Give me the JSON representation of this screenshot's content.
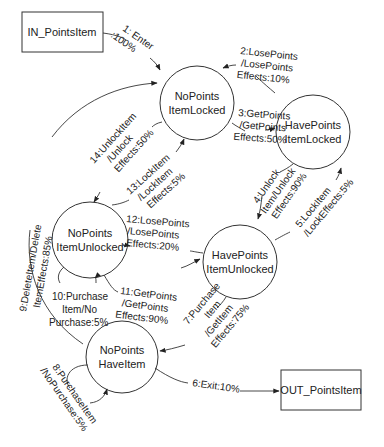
{
  "diagram": {
    "type": "state-transition",
    "terminals": {
      "in": {
        "label": "IN_PointsItem"
      },
      "out": {
        "label": "OUT_PointsItem"
      }
    },
    "states": [
      {
        "id": "nplocked",
        "line1": "NoPoints",
        "line2": "ItemLocked"
      },
      {
        "id": "hplocked",
        "line1": "HavePoints",
        "line2": "ItemLocked"
      },
      {
        "id": "npunlocked",
        "line1": "NoPoints",
        "line2": "ItemUnlocked"
      },
      {
        "id": "hpunlocked",
        "line1": "HavePoints",
        "line2": "ItemUnlocked"
      },
      {
        "id": "nphaveitem",
        "line1": "NoPoints",
        "line2": "HaveItem"
      }
    ],
    "transitions": [
      {
        "id": 1,
        "from": "in",
        "to": "nplocked",
        "lines": [
          "1: Enter",
          ":100%"
        ]
      },
      {
        "id": 2,
        "from": "hplocked",
        "to": "nplocked",
        "lines": [
          "2:LosePoints",
          "/LosePoints",
          "Effects:10%"
        ]
      },
      {
        "id": 3,
        "from": "nplocked",
        "to": "hplocked",
        "lines": [
          "3:GetPoints",
          "/GetPoints",
          "Effects:50%"
        ]
      },
      {
        "id": 4,
        "from": "hplocked",
        "to": "hpunlocked",
        "lines": [
          "4:Unlock",
          "Item/Unlock",
          "Effects:90%"
        ]
      },
      {
        "id": 5,
        "from": "hpunlocked",
        "to": "hplocked",
        "lines": [
          "5:LockItem",
          "/LockEffects:5%"
        ]
      },
      {
        "id": 6,
        "from": "nphaveitem",
        "to": "out",
        "lines": [
          "6:Exit:10%"
        ]
      },
      {
        "id": 7,
        "from": "hpunlocked",
        "to": "nphaveitem",
        "lines": [
          "7:Purchase",
          "Item",
          "/GetItem",
          "Effects:75%"
        ]
      },
      {
        "id": 8,
        "from": "nphaveitem",
        "to": "nphaveitem",
        "lines": [
          "8:PurchaseItem",
          "/NoPurchase:5%"
        ]
      },
      {
        "id": 9,
        "from": "nphaveitem",
        "to": "nplocked",
        "lines": [
          "9:DeleteItem/Delete",
          "ItemEffects:85%"
        ]
      },
      {
        "id": 10,
        "from": "npunlocked",
        "to": "npunlocked",
        "lines": [
          "10:Purchase",
          "Item/No",
          "Purchase:5%"
        ]
      },
      {
        "id": 11,
        "from": "npunlocked",
        "to": "hpunlocked",
        "lines": [
          "11:GetPoints",
          "/GetPoints",
          "Effects:90%"
        ]
      },
      {
        "id": 12,
        "from": "hpunlocked",
        "to": "npunlocked",
        "lines": [
          "12:LosePoints",
          "/LosePoints",
          "Effects:20%"
        ]
      },
      {
        "id": 13,
        "from": "npunlocked",
        "to": "nplocked",
        "lines": [
          "13:LockItem",
          "/LockItem",
          "Effects:5%"
        ]
      },
      {
        "id": 14,
        "from": "nplocked",
        "to": "npunlocked",
        "lines": [
          "14:UnlockItem",
          "/Unlock",
          "Effects:50%"
        ]
      }
    ]
  }
}
